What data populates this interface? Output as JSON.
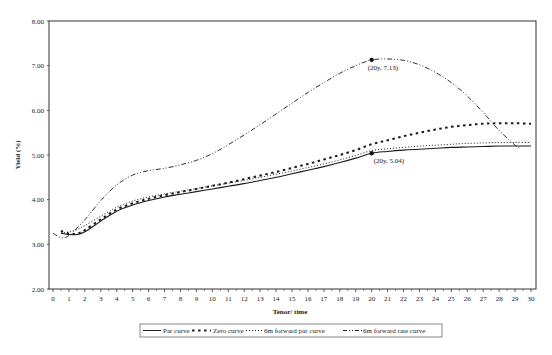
{
  "chart_data": {
    "type": "line",
    "title": "",
    "xlabel": "Tenor/ time",
    "ylabel": "Yield (%)",
    "xlim": [
      0,
      30
    ],
    "ylim": [
      2.0,
      8.0
    ],
    "x_ticks": [
      "0",
      "1",
      "2",
      "3",
      "4",
      "5",
      "6",
      "7",
      "8",
      "9",
      "10",
      "11",
      "12",
      "13",
      "14",
      "15",
      "16",
      "17",
      "18",
      "19",
      "20",
      "21",
      "22",
      "23",
      "24",
      "25",
      "26",
      "27",
      "28",
      "29",
      "30"
    ],
    "y_ticks": [
      "2.00",
      "3.00",
      "4.00",
      "5.00",
      "6.00",
      "7.00",
      "8.00"
    ],
    "grid": false,
    "legend_position": "bottom",
    "series": [
      {
        "name": "Par curve",
        "style": "solid",
        "points": [
          [
            0.5,
            3.25
          ],
          [
            1,
            3.22
          ],
          [
            1.5,
            3.22
          ],
          [
            2,
            3.28
          ],
          [
            3,
            3.52
          ],
          [
            4,
            3.74
          ],
          [
            5,
            3.88
          ],
          [
            6,
            3.98
          ],
          [
            7,
            4.06
          ],
          [
            8,
            4.12
          ],
          [
            9,
            4.18
          ],
          [
            10,
            4.24
          ],
          [
            11,
            4.3
          ],
          [
            12,
            4.36
          ],
          [
            13,
            4.43
          ],
          [
            14,
            4.5
          ],
          [
            15,
            4.58
          ],
          [
            16,
            4.66
          ],
          [
            17,
            4.74
          ],
          [
            18,
            4.83
          ],
          [
            19,
            4.93
          ],
          [
            20,
            5.04
          ],
          [
            21,
            5.08
          ],
          [
            22,
            5.11
          ],
          [
            23,
            5.13
          ],
          [
            24,
            5.15
          ],
          [
            25,
            5.17
          ],
          [
            26,
            5.18
          ],
          [
            27,
            5.19
          ],
          [
            28,
            5.2
          ],
          [
            29,
            5.2
          ],
          [
            30,
            5.2
          ]
        ]
      },
      {
        "name": "Zero curve",
        "style": "dashed",
        "points": [
          [
            0.5,
            3.3
          ],
          [
            1,
            3.24
          ],
          [
            1.5,
            3.24
          ],
          [
            2,
            3.32
          ],
          [
            3,
            3.56
          ],
          [
            4,
            3.78
          ],
          [
            5,
            3.92
          ],
          [
            6,
            4.02
          ],
          [
            7,
            4.1
          ],
          [
            8,
            4.17
          ],
          [
            9,
            4.24
          ],
          [
            10,
            4.31
          ],
          [
            11,
            4.38
          ],
          [
            12,
            4.46
          ],
          [
            13,
            4.54
          ],
          [
            14,
            4.62
          ],
          [
            15,
            4.71
          ],
          [
            16,
            4.8
          ],
          [
            17,
            4.9
          ],
          [
            18,
            5.0
          ],
          [
            19,
            5.11
          ],
          [
            20,
            5.24
          ],
          [
            21,
            5.33
          ],
          [
            22,
            5.42
          ],
          [
            23,
            5.5
          ],
          [
            24,
            5.57
          ],
          [
            25,
            5.63
          ],
          [
            26,
            5.67
          ],
          [
            27,
            5.7
          ],
          [
            28,
            5.71
          ],
          [
            29,
            5.71
          ],
          [
            30,
            5.7
          ]
        ]
      },
      {
        "name": "6m forward par curve",
        "style": "dotted",
        "points": [
          [
            0.5,
            3.25
          ],
          [
            1,
            3.28
          ],
          [
            1.5,
            3.33
          ],
          [
            2,
            3.42
          ],
          [
            3,
            3.63
          ],
          [
            4,
            3.83
          ],
          [
            5,
            3.97
          ],
          [
            6,
            4.06
          ],
          [
            7,
            4.13
          ],
          [
            8,
            4.19
          ],
          [
            9,
            4.25
          ],
          [
            10,
            4.31
          ],
          [
            11,
            4.37
          ],
          [
            12,
            4.43
          ],
          [
            13,
            4.5
          ],
          [
            14,
            4.57
          ],
          [
            15,
            4.64
          ],
          [
            16,
            4.72
          ],
          [
            17,
            4.8
          ],
          [
            18,
            4.89
          ],
          [
            19,
            4.99
          ],
          [
            20,
            5.1
          ],
          [
            21,
            5.14
          ],
          [
            22,
            5.17
          ],
          [
            23,
            5.2
          ],
          [
            24,
            5.22
          ],
          [
            25,
            5.24
          ],
          [
            26,
            5.26
          ],
          [
            27,
            5.27
          ],
          [
            28,
            5.28
          ],
          [
            29,
            5.28
          ],
          [
            30,
            5.28
          ]
        ]
      },
      {
        "name": "6m forward rate curve",
        "style": "dash-dot",
        "points": [
          [
            0,
            3.25
          ],
          [
            0.5,
            3.15
          ],
          [
            1,
            3.2
          ],
          [
            2,
            3.55
          ],
          [
            3,
            3.98
          ],
          [
            4,
            4.33
          ],
          [
            5,
            4.55
          ],
          [
            6,
            4.65
          ],
          [
            7,
            4.7
          ],
          [
            8,
            4.78
          ],
          [
            9,
            4.88
          ],
          [
            10,
            5.03
          ],
          [
            11,
            5.23
          ],
          [
            12,
            5.45
          ],
          [
            13,
            5.68
          ],
          [
            14,
            5.92
          ],
          [
            15,
            6.16
          ],
          [
            16,
            6.4
          ],
          [
            17,
            6.62
          ],
          [
            18,
            6.83
          ],
          [
            19,
            7.0
          ],
          [
            20,
            7.13
          ],
          [
            21,
            7.15
          ],
          [
            22,
            7.12
          ],
          [
            23,
            7.02
          ],
          [
            24,
            6.85
          ],
          [
            25,
            6.62
          ],
          [
            26,
            6.32
          ],
          [
            27,
            5.95
          ],
          [
            28,
            5.55
          ],
          [
            29,
            5.22
          ],
          [
            29.3,
            5.15
          ]
        ]
      }
    ],
    "annotations": [
      {
        "label": "(20y, 7.13)",
        "x": 20,
        "y": 7.13,
        "series": "6m forward rate curve"
      },
      {
        "label": "(20y, 5.04)",
        "x": 20,
        "y": 5.04,
        "series": "Par curve"
      }
    ]
  },
  "axes": {
    "xlabel": "Tenor/ time",
    "ylabel": "Yield (%)"
  },
  "legend": {
    "items": [
      {
        "label": "Par curve",
        "style": "solid"
      },
      {
        "label": "Zero curve",
        "style": "dashed"
      },
      {
        "label": "6m forward par curve",
        "style": "dotted"
      },
      {
        "label": "6m forward rate curve",
        "style": "dash-dot"
      }
    ]
  },
  "annotations": {
    "peak": "(20y, 7.13)",
    "par20": "(20y, 5.04)"
  }
}
